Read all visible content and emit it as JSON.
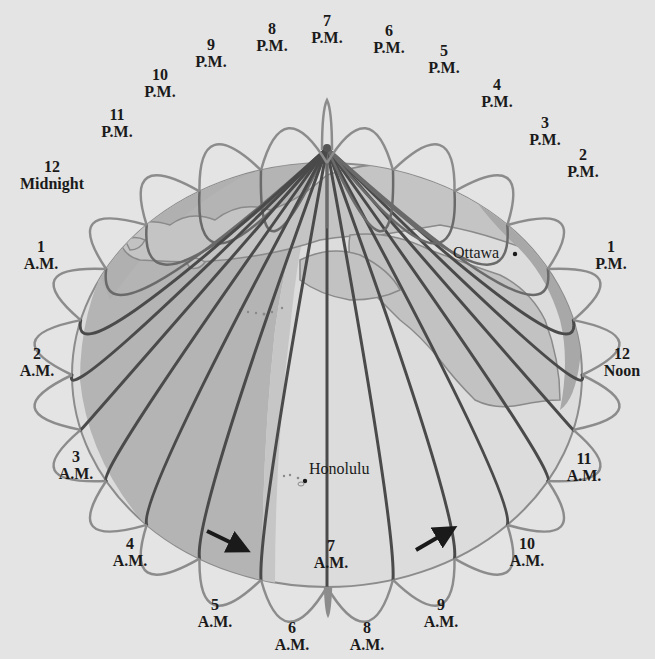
{
  "diagram": {
    "pole": {
      "x": 327,
      "y": 148
    },
    "colors": {
      "background": "#e4e4e4",
      "night_shading": "#b4b4b4",
      "twilight_shading": "#c8c8c8",
      "land": "#c4c4c4",
      "land_outline": "#8a8a8a",
      "meridian_dark": "#4a4a4a",
      "meridian_light": "#8c8c8c",
      "label_text": "#1a1a1a",
      "arrow": "#1a1a1a"
    },
    "time_labels": [
      {
        "id": "7pm",
        "number": "7",
        "suffix": "P.M.",
        "x": 327,
        "y": 12
      },
      {
        "id": "8pm",
        "number": "8",
        "suffix": "P.M.",
        "x": 272,
        "y": 20
      },
      {
        "id": "9pm",
        "number": "9",
        "suffix": "P.M.",
        "x": 211,
        "y": 36
      },
      {
        "id": "10pm",
        "number": "10",
        "suffix": "P.M.",
        "x": 160,
        "y": 66
      },
      {
        "id": "11pm",
        "number": "11",
        "suffix": "P.M.",
        "x": 117,
        "y": 106
      },
      {
        "id": "12midnight",
        "number": "12",
        "suffix": "Midnight",
        "x": 52,
        "y": 158
      },
      {
        "id": "1am",
        "number": "1",
        "suffix": "A.M.",
        "x": 41,
        "y": 238
      },
      {
        "id": "2am",
        "number": "2",
        "suffix": "A.M.",
        "x": 37,
        "y": 345
      },
      {
        "id": "3am",
        "number": "3",
        "suffix": "A.M.",
        "x": 76,
        "y": 448
      },
      {
        "id": "4am",
        "number": "4",
        "suffix": "A.M.",
        "x": 130,
        "y": 535
      },
      {
        "id": "5am",
        "number": "5",
        "suffix": "A.M.",
        "x": 215,
        "y": 596
      },
      {
        "id": "6am",
        "number": "6",
        "suffix": "A.M.",
        "x": 292,
        "y": 619
      },
      {
        "id": "7am",
        "number": "7",
        "suffix": "A.M.",
        "x": 331,
        "y": 537
      },
      {
        "id": "8am",
        "number": "8",
        "suffix": "A.M.",
        "x": 367,
        "y": 619
      },
      {
        "id": "9am",
        "number": "9",
        "suffix": "A.M.",
        "x": 441,
        "y": 596
      },
      {
        "id": "10am",
        "number": "10",
        "suffix": "A.M.",
        "x": 527,
        "y": 535
      },
      {
        "id": "11am",
        "number": "11",
        "suffix": "A.M.",
        "x": 584,
        "y": 450
      },
      {
        "id": "12noon",
        "number": "12",
        "suffix": "Noon",
        "x": 622,
        "y": 345
      },
      {
        "id": "1pm",
        "number": "1",
        "suffix": "P.M.",
        "x": 611,
        "y": 238
      },
      {
        "id": "2pm",
        "number": "2",
        "suffix": "P.M.",
        "x": 583,
        "y": 146
      },
      {
        "id": "3pm",
        "number": "3",
        "suffix": "P.M.",
        "x": 545,
        "y": 114
      },
      {
        "id": "4pm",
        "number": "4",
        "suffix": "P.M.",
        "x": 497,
        "y": 76
      },
      {
        "id": "5pm",
        "number": "5",
        "suffix": "P.M.",
        "x": 444,
        "y": 42
      },
      {
        "id": "6pm",
        "number": "6",
        "suffix": "P.M.",
        "x": 389,
        "y": 22
      }
    ],
    "cities": [
      {
        "id": "ottawa",
        "name": "Ottawa",
        "x": 453,
        "y": 246,
        "dot_x": 515,
        "dot_y": 254
      },
      {
        "id": "honolulu",
        "name": "Honolulu",
        "x": 309,
        "y": 462,
        "dot_x": 305,
        "dot_y": 481
      }
    ],
    "arrows": [
      {
        "id": "arrow-left",
        "direction": "down-right",
        "x1": 207,
        "y1": 531,
        "x2": 246,
        "y2": 550
      },
      {
        "id": "arrow-right",
        "direction": "up-right",
        "x1": 416,
        "y1": 550,
        "x2": 452,
        "y2": 529
      }
    ]
  }
}
